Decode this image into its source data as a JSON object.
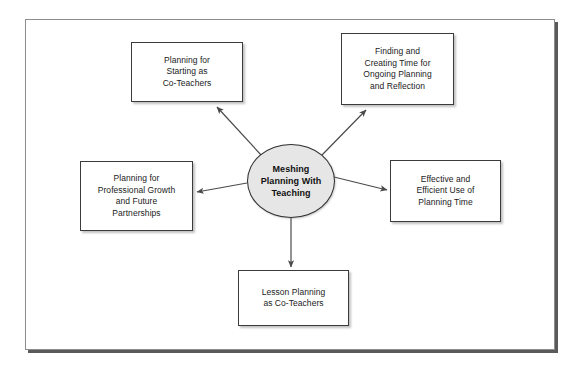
{
  "diagram": {
    "type": "hub-and-spoke",
    "title": "Meshing Planning With Teaching",
    "center": {
      "id": "center",
      "label": "Meshing\nPlanning With\nTeaching",
      "shape": "ellipse",
      "fill": "#e6e6e6",
      "stroke": "#2f2f2f",
      "bold": true
    },
    "nodes": [
      {
        "id": "top-left",
        "label": "Planning for\nStarting as\nCo-Teachers",
        "shape": "rectangle",
        "fill": "#ffffff",
        "stroke": "#3b3b3b",
        "position": "upper-left"
      },
      {
        "id": "top-right",
        "label": "Finding and\nCreating Time for\nOngoing Planning\nand Reflection",
        "shape": "rectangle",
        "fill": "#ffffff",
        "stroke": "#3b3b3b",
        "position": "upper-right"
      },
      {
        "id": "left",
        "label": "Planning for\nProfessional Growth\nand Future\nPartnerships",
        "shape": "rectangle",
        "fill": "#ffffff",
        "stroke": "#3b3b3b",
        "position": "left"
      },
      {
        "id": "right",
        "label": "Effective and\nEfficient Use of\nPlanning Time",
        "shape": "rectangle",
        "fill": "#ffffff",
        "stroke": "#3b3b3b",
        "position": "right"
      },
      {
        "id": "bottom",
        "label": "Lesson Planning\nas Co-Teachers",
        "shape": "rectangle",
        "fill": "#ffffff",
        "stroke": "#3b3b3b",
        "position": "bottom"
      }
    ],
    "arrows": [
      {
        "from": "center",
        "to": "top-left",
        "direction": "outward",
        "style": "solid"
      },
      {
        "from": "center",
        "to": "top-right",
        "direction": "outward",
        "style": "solid"
      },
      {
        "from": "center",
        "to": "left",
        "direction": "outward",
        "style": "solid"
      },
      {
        "from": "center",
        "to": "right",
        "direction": "outward",
        "style": "solid"
      },
      {
        "from": "center",
        "to": "bottom",
        "direction": "outward",
        "style": "solid"
      }
    ],
    "frame": {
      "stroke": "#8d8d8d",
      "shadow": "#5a5a5a",
      "background": "#ffffff"
    },
    "canvas": {
      "background": "#ffffff",
      "line_color": "#4a4a4a"
    }
  }
}
